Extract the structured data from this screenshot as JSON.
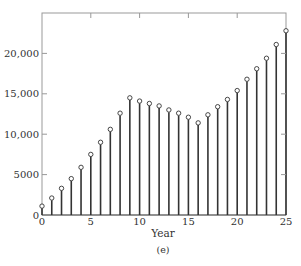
{
  "chart_data": {
    "type": "stem",
    "title": "",
    "xlabel": "Year",
    "ylabel": "",
    "caption": "(e)",
    "xlim": [
      0,
      25
    ],
    "ylim": [
      0,
      25000
    ],
    "x_ticks": [
      0,
      5,
      10,
      15,
      20,
      25
    ],
    "x_tick_labels": [
      "0",
      "5",
      "10",
      "15",
      "20",
      "25"
    ],
    "y_ticks": [
      0,
      5000,
      10000,
      15000,
      20000
    ],
    "y_tick_labels": [
      "0",
      "5000",
      "10,000",
      "15,000",
      "20,000"
    ],
    "grid": false,
    "legend": null,
    "x": [
      0,
      1,
      2,
      3,
      4,
      5,
      6,
      7,
      8,
      9,
      10,
      11,
      12,
      13,
      14,
      15,
      16,
      17,
      18,
      19,
      20,
      21,
      22,
      23,
      24,
      25
    ],
    "values": [
      1100,
      2100,
      3300,
      4500,
      5900,
      7500,
      9000,
      10600,
      12600,
      14500,
      14100,
      13800,
      13500,
      13000,
      12600,
      12100,
      11400,
      12400,
      13400,
      14300,
      15400,
      16800,
      18100,
      19400,
      21100,
      22800
    ],
    "colors": {
      "stem": "#333333",
      "frame": "#999999",
      "marker_fill": "#ffffff",
      "marker_stroke": "#333333"
    }
  }
}
